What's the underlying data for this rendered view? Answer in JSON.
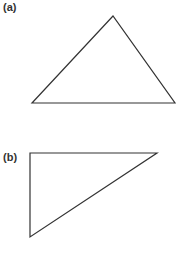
{
  "figures": [
    {
      "label": "(a)",
      "label_pos": [
        3,
        1
      ],
      "shape": "triangle",
      "points": "113,16 32,103 175,103"
    },
    {
      "label": "(b)",
      "label_pos": [
        3,
        151
      ],
      "shape": "triangle",
      "points": "30,153 157,153 30,237"
    }
  ],
  "stroke_color": "#333333"
}
